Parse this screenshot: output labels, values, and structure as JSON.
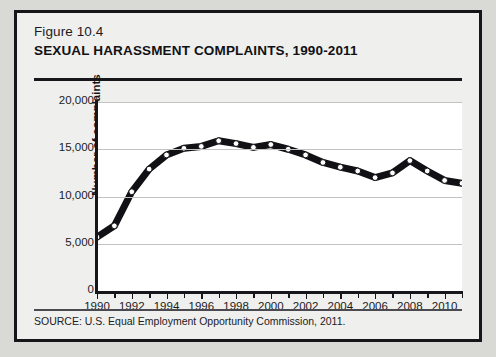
{
  "figure": {
    "number": "Figure 10.4",
    "title": "SEXUAL HARASSMENT COMPLAINTS, 1990-2011",
    "source": "SOURCE: U.S. Equal Employment Opportunity Commission, 2011."
  },
  "colors": {
    "page_background": "#d9d9d6",
    "card_background": "#efefed",
    "frame": "#16161a",
    "plot_background": "#ffffff",
    "line": "#111115",
    "marker_fill": "#ffffff",
    "gridline": "#c3c3c3",
    "axis": "#17171b"
  },
  "chart_data": {
    "type": "line",
    "title": "SEXUAL HARASSMENT COMPLAINTS, 1990-2011",
    "xlabel": "",
    "ylabel": "Number of complaints",
    "x": [
      1990,
      1991,
      1992,
      1993,
      1994,
      1995,
      1996,
      1997,
      1998,
      1999,
      2000,
      2001,
      2002,
      2003,
      2004,
      2005,
      2006,
      2007,
      2008,
      2009,
      2010,
      2011
    ],
    "values": [
      5700,
      6900,
      10500,
      12900,
      14400,
      15100,
      15300,
      15900,
      15600,
      15200,
      15500,
      15000,
      14400,
      13600,
      13100,
      12700,
      12000,
      12500,
      13800,
      12700,
      11700,
      11400
    ],
    "xlim": [
      1990,
      2011
    ],
    "ylim": [
      0,
      20000
    ],
    "ytick_values": [
      0,
      5000,
      10000,
      15000,
      20000
    ],
    "ytick_labels": [
      "0",
      "5,000",
      "10,000",
      "15,000",
      "20,000"
    ],
    "xtick_values": [
      1990,
      1992,
      1994,
      1996,
      1998,
      2000,
      2002,
      2004,
      2006,
      2008,
      2010
    ],
    "xtick_labels": [
      "1990",
      "1992",
      "1994",
      "1996",
      "1998",
      "2000",
      "2002",
      "2004",
      "2006",
      "2008",
      "2010"
    ],
    "xtick_minor_values": [
      1991,
      1993,
      1995,
      1997,
      1999,
      2001,
      2003,
      2005,
      2007,
      2009,
      2011
    ],
    "grid": "horizontal",
    "legend": "none",
    "markers": "open-circle",
    "series_name": "Number of complaints"
  }
}
